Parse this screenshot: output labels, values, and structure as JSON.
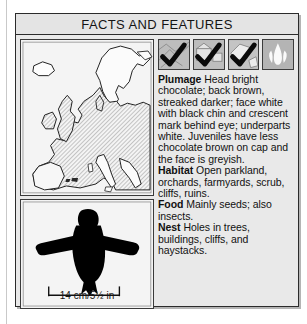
{
  "panel": {
    "title": "FACTS AND FEATURES"
  },
  "map": {
    "name": "distribution-map-europe",
    "caption": ""
  },
  "silhouette": {
    "name": "bird-silhouette",
    "scale_caption": "14 cm/5½ in"
  },
  "icons": [
    {
      "name": "habitat-icon-1",
      "checked": true,
      "label": "habitat icon with check"
    },
    {
      "name": "habitat-icon-2",
      "checked": true,
      "label": "habitat icon with check"
    },
    {
      "name": "habitat-icon-3",
      "checked": true,
      "label": "habitat icon with check"
    },
    {
      "name": "habitat-icon-4",
      "checked": false,
      "label": "flame habitat icon, unchecked"
    }
  ],
  "facts": [
    {
      "lead": "Plumage",
      "text": " Head bright chocolate; back brown, streaked darker; face white with black chin and crescent mark behind eye; underparts white. Juveniles have less chocolate brown on cap and the face is greyish."
    },
    {
      "lead": "Habitat",
      "text": " Open parkland, orchards, farmyards, scrub, cliffs, ruins."
    },
    {
      "lead": "Food",
      "text": " Mainly seeds; also insects."
    },
    {
      "lead": "Nest",
      "text": " Holes in trees, buildings, cliffs, and haystacks."
    }
  ],
  "colors": {
    "panel_background": "#e9e9e9",
    "border": "#2b2b2b",
    "map_land_shaded": "#c0c0c0",
    "map_land_plain": "#f7f7f7",
    "silhouette": "#000000"
  }
}
